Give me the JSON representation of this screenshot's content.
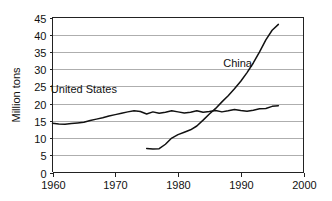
{
  "chart_data": {
    "type": "line",
    "title": "",
    "subtitle": "",
    "xlabel": "",
    "ylabel": "Million tons",
    "xlim": [
      1960,
      2000
    ],
    "ylim": [
      0,
      45
    ],
    "xticks": [
      1960,
      1970,
      1980,
      1990,
      2000
    ],
    "xtick_labels": [
      "1960",
      "1970",
      "1980",
      "1990",
      "2000"
    ],
    "yticks": [
      0,
      5,
      10,
      15,
      20,
      25,
      30,
      35,
      40,
      45
    ],
    "ytick_labels": [
      "0",
      "5",
      "10",
      "15",
      "20",
      "25",
      "30",
      "35",
      "40",
      "45"
    ],
    "grid": "horizontal",
    "legend": "inline-annotations",
    "annotations": [
      {
        "text": "China",
        "x": 1989.5,
        "y": 30.5
      },
      {
        "text": "United States",
        "x": 1965.0,
        "y": 23.0
      }
    ],
    "series": [
      {
        "name": "United States",
        "color": "#111111",
        "x": [
          1960,
          1961,
          1962,
          1963,
          1964,
          1965,
          1966,
          1967,
          1968,
          1969,
          1970,
          1971,
          1972,
          1973,
          1974,
          1975,
          1976,
          1977,
          1978,
          1979,
          1980,
          1981,
          1982,
          1983,
          1984,
          1985,
          1986,
          1987,
          1988,
          1989,
          1990,
          1991,
          1992,
          1993,
          1994,
          1995,
          1996
        ],
        "values": [
          14.3,
          14.1,
          14.0,
          14.2,
          14.4,
          14.6,
          15.1,
          15.5,
          15.9,
          16.4,
          16.8,
          17.2,
          17.6,
          17.9,
          17.7,
          17.0,
          17.6,
          17.2,
          17.5,
          17.9,
          17.6,
          17.3,
          17.5,
          17.9,
          17.5,
          17.7,
          18.0,
          17.6,
          17.9,
          18.3,
          18.0,
          17.8,
          18.1,
          18.5,
          18.6,
          19.2,
          19.4
        ]
      },
      {
        "name": "China",
        "color": "#111111",
        "x": [
          1975,
          1976,
          1977,
          1978,
          1979,
          1980,
          1981,
          1982,
          1983,
          1984,
          1985,
          1986,
          1987,
          1988,
          1989,
          1990,
          1991,
          1992,
          1993,
          1994,
          1995,
          1996
        ],
        "values": [
          7.0,
          6.8,
          6.9,
          8.2,
          10.0,
          11.0,
          11.7,
          12.4,
          13.5,
          15.2,
          17.0,
          18.6,
          20.5,
          22.3,
          24.3,
          26.5,
          29.0,
          31.8,
          35.0,
          38.5,
          41.3,
          43.0
        ]
      }
    ]
  },
  "axes": {
    "y_axis_title": "Million tons"
  }
}
